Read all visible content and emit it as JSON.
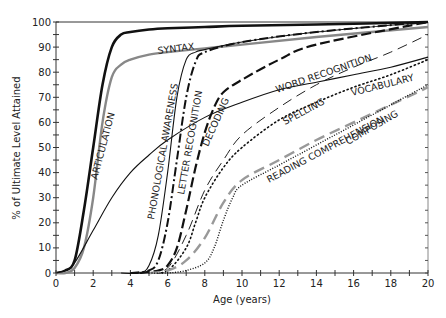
{
  "chart_data": {
    "type": "line",
    "title": "",
    "xlabel": "Age (years)",
    "ylabel": "% of Ultimate Level Attained",
    "xlim": [
      0,
      20
    ],
    "ylim": [
      0,
      100
    ],
    "x_ticks": [
      0,
      2,
      4,
      6,
      8,
      10,
      12,
      14,
      16,
      18,
      20
    ],
    "y_ticks": [
      0,
      10,
      20,
      30,
      40,
      50,
      60,
      70,
      80,
      90,
      100
    ],
    "grid": false,
    "legend": "inline labels on curves",
    "series": [
      {
        "name": "ARTICULATION",
        "style": "solid-thick-black",
        "x": [
          0,
          0.5,
          1,
          1.5,
          2,
          2.5,
          3,
          3.5,
          4,
          5,
          6,
          8,
          10,
          14,
          20
        ],
        "y": [
          0,
          1,
          5,
          25,
          50,
          75,
          90,
          95,
          96,
          97,
          97.5,
          98,
          98.5,
          99,
          100
        ]
      },
      {
        "name": "SYNTAX",
        "style": "solid-thick-gray",
        "x": [
          0,
          0.5,
          1,
          1.5,
          2,
          2.5,
          3,
          3.5,
          4,
          5,
          6,
          8,
          10,
          14,
          20
        ],
        "y": [
          0,
          0,
          2,
          10,
          30,
          60,
          78,
          83,
          85,
          87,
          88,
          89.5,
          91,
          94,
          98
        ]
      },
      {
        "name": "VOCABULARY",
        "style": "solid-thin-black",
        "x": [
          0,
          0.5,
          1,
          2,
          3,
          4,
          5,
          6,
          8,
          10,
          12,
          14,
          16,
          18,
          20
        ],
        "y": [
          0,
          1,
          4,
          17,
          30,
          40,
          47,
          53,
          62,
          68,
          73,
          76,
          79,
          82,
          86
        ]
      },
      {
        "name": "PHONOLOGICAL AWARENESS",
        "style": "solid-thin-black",
        "x": [
          3.5,
          4.5,
          5,
          5.5,
          6,
          6.5,
          7,
          7.5,
          8,
          10,
          14,
          20
        ],
        "y": [
          0,
          0,
          3,
          15,
          40,
          70,
          85,
          88,
          89,
          92,
          96,
          100
        ]
      },
      {
        "name": "LETTER RECOGNITION",
        "style": "dash-dot-black",
        "x": [
          4,
          5,
          5.5,
          6,
          6.5,
          7,
          7.5,
          8,
          10,
          14,
          20
        ],
        "y": [
          0,
          1,
          5,
          20,
          45,
          70,
          84,
          88,
          92,
          96,
          100
        ]
      },
      {
        "name": "DECODING",
        "style": "long-dash-black",
        "x": [
          4.5,
          5.5,
          6,
          6.5,
          7,
          7.5,
          8,
          8.5,
          9,
          10,
          12,
          14,
          20
        ],
        "y": [
          0,
          1,
          3,
          10,
          25,
          42,
          56,
          66,
          72,
          77,
          85,
          91,
          100
        ]
      },
      {
        "name": "WORD RECOGNITION",
        "style": "thin-dash-black",
        "x": [
          5,
          6,
          7,
          8,
          9,
          10,
          12,
          14,
          16,
          18,
          20
        ],
        "y": [
          0,
          2,
          15,
          33,
          45,
          55,
          66,
          75,
          82,
          88,
          95
        ]
      },
      {
        "name": "SPELLING",
        "style": "dotted-black",
        "x": [
          5,
          6,
          7,
          7.5,
          8,
          9,
          10,
          12,
          14,
          16,
          18,
          20
        ],
        "y": [
          0,
          1,
          10,
          20,
          30,
          42,
          50,
          61,
          68,
          74,
          79,
          85
        ]
      },
      {
        "name": "READING COMPREHENSION",
        "style": "dash-gray",
        "x": [
          5,
          6,
          7,
          8,
          9,
          10,
          12,
          14,
          16,
          18,
          20
        ],
        "y": [
          0,
          1,
          5,
          14,
          28,
          37,
          45,
          53,
          60,
          67,
          74
        ]
      },
      {
        "name": "COMPOSING",
        "style": "dotted-fine-black",
        "x": [
          5,
          6,
          7,
          8,
          8.5,
          9,
          9.5,
          10,
          12,
          14,
          16,
          18,
          20
        ],
        "y": [
          0,
          0,
          1,
          4,
          10,
          21,
          30,
          35,
          43,
          51,
          59,
          67,
          75
        ]
      }
    ]
  },
  "labels": {
    "articulation": "ARTICULATION",
    "syntax": "SYNTAX",
    "phonological": "PHONOLOGICAL AWARENESS",
    "letter": "LETTER RECOGNITION",
    "decoding": "DECODING",
    "word": "WORD RECOGNITION",
    "spelling": "SPELLING",
    "vocabulary": "VOCABULARY",
    "reading": "READING COMPREHENSION",
    "composing": "COMPOSING"
  },
  "axes": {
    "xlabel": "Age (years)",
    "ylabel": "% of Ultimate Level Attained"
  }
}
